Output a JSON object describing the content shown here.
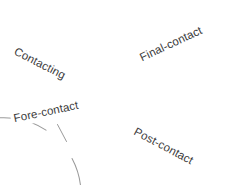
{
  "diagram": {
    "type": "cycle",
    "background_color": "#ffffff",
    "stroke_color": "#9a9a9a",
    "text_color": "#3c3c3c",
    "circle": {
      "center_x": 114,
      "center_y": 94,
      "radius": 77
    },
    "labels": [
      {
        "id": "contacting",
        "text": "Contacting",
        "position": "upper-left",
        "rotation_deg": 27
      },
      {
        "id": "final-contact",
        "text": "Final-contact",
        "position": "upper-right",
        "rotation_deg": -25
      },
      {
        "id": "fore-contact",
        "text": "Fore-contact",
        "position": "lower-left",
        "rotation_deg": -12
      },
      {
        "id": "post-contact",
        "text": "Post-contact",
        "position": "lower-right",
        "rotation_deg": 28
      }
    ]
  }
}
